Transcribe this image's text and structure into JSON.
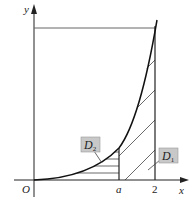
{
  "diagram": {
    "type": "function-region-diagram",
    "axes": {
      "x_label": "x",
      "y_label": "y",
      "origin_label": "O"
    },
    "ticks": {
      "a_label": "a",
      "two_label": "2"
    },
    "regions": {
      "d1_label": "D",
      "d1_sub": "1",
      "d2_label": "D",
      "d2_sub": "2"
    },
    "colors": {
      "line": "#222222",
      "hatch": "#444444",
      "label_box": "#c8c8c8",
      "label_box_border": "#999999"
    }
  }
}
